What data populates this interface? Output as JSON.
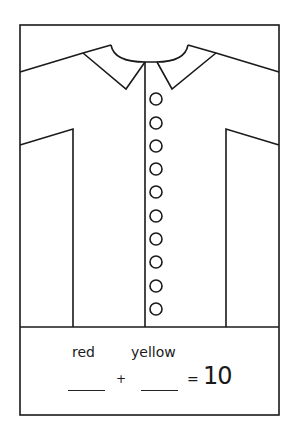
{
  "worksheet": {
    "figure": "shirt",
    "button_count": 10,
    "equation": {
      "label_1": "red",
      "label_2": "yellow",
      "plus": "+",
      "equals": "=",
      "total": "10"
    },
    "colors": {
      "line": "#1a1a1a",
      "background": "#ffffff"
    }
  }
}
